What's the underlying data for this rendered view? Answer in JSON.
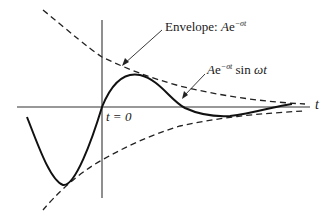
{
  "diagram": {
    "labels": {
      "envelope_prefix": "Envelope: ",
      "envelope_A": "A",
      "envelope_e": "e",
      "envelope_exp": "−σt",
      "curve_A": "A",
      "curve_e": "e",
      "curve_exp": "−σt",
      "curve_sin": " sin ",
      "curve_wt": "ωt",
      "t0": "t = 0",
      "t_axis": "t"
    },
    "colors": {
      "curve": "#111111",
      "axis": "#333333",
      "envelope": "#222222"
    }
  }
}
